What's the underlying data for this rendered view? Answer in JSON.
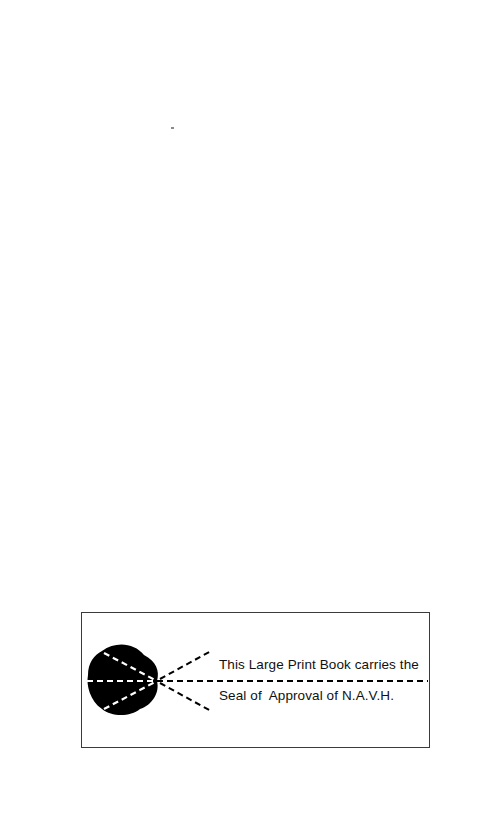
{
  "page": {
    "background": "#ffffff",
    "seal": {
      "line1": "This Large Print Book carries the",
      "line2": "Seal of  Approval of N.A.V.H.",
      "icon": "eye-icon",
      "border_color": "#3a3a3a",
      "ink_color": "#000000"
    }
  }
}
